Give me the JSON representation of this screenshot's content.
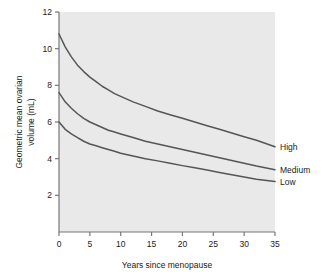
{
  "chart_data": {
    "type": "line",
    "title": "",
    "xlabel": "Years since menopause",
    "ylabel": "Geometric mean ovarian volume (mL)",
    "ylabel_line1": "Geometric mean ovarian",
    "ylabel_line2": "volume (mL)",
    "xlim": [
      0,
      35
    ],
    "ylim": [
      0,
      12
    ],
    "xticks": [
      0,
      5,
      10,
      15,
      20,
      25,
      30,
      35
    ],
    "xtick_labels": [
      "0",
      "5",
      "10",
      "15",
      "20",
      "25",
      "30",
      "35"
    ],
    "yticks": [
      2,
      4,
      6,
      8,
      10,
      12
    ],
    "ytick_labels": [
      "2",
      "4",
      "6",
      "8",
      "10",
      "12"
    ],
    "grid": false,
    "legend_position": "right-inline",
    "plot_background": "#e9e9e9",
    "line_color": "#555555",
    "x": [
      0,
      1,
      2,
      3,
      4,
      5,
      6,
      7,
      8,
      9,
      10,
      12,
      14,
      16,
      18,
      20,
      22,
      24,
      26,
      28,
      30,
      32,
      35
    ],
    "series": [
      {
        "name": "High",
        "label": "High",
        "values": [
          10.8,
          10.1,
          9.55,
          9.1,
          8.75,
          8.45,
          8.2,
          7.95,
          7.75,
          7.55,
          7.4,
          7.1,
          6.85,
          6.6,
          6.4,
          6.2,
          6.0,
          5.8,
          5.6,
          5.4,
          5.2,
          5.0,
          4.65
        ]
      },
      {
        "name": "Medium",
        "label": "Medium",
        "values": [
          7.6,
          7.1,
          6.75,
          6.45,
          6.2,
          6.0,
          5.85,
          5.7,
          5.55,
          5.45,
          5.35,
          5.15,
          4.95,
          4.8,
          4.65,
          4.5,
          4.35,
          4.2,
          4.05,
          3.9,
          3.75,
          3.6,
          3.4
        ]
      },
      {
        "name": "Low",
        "label": "Low",
        "values": [
          6.0,
          5.6,
          5.35,
          5.15,
          4.95,
          4.8,
          4.7,
          4.6,
          4.5,
          4.4,
          4.3,
          4.15,
          4.0,
          3.88,
          3.75,
          3.62,
          3.5,
          3.38,
          3.25,
          3.12,
          3.0,
          2.88,
          2.75
        ]
      }
    ]
  },
  "figure": {
    "axis_color": "#777777",
    "text_color": "#1a1a1a"
  }
}
